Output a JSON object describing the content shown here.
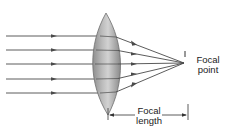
{
  "diagram": {
    "labels": {
      "focal_point_line1": "Focal",
      "focal_point_line2": "point",
      "focal_length_line1": "Focal",
      "focal_length_line2": "length"
    },
    "colors": {
      "ray": "#4a4a4a",
      "lens_fill": "#a8a8a8",
      "lens_edge": "#6e6e6e",
      "text": "#222222"
    },
    "ray_count": 5
  }
}
